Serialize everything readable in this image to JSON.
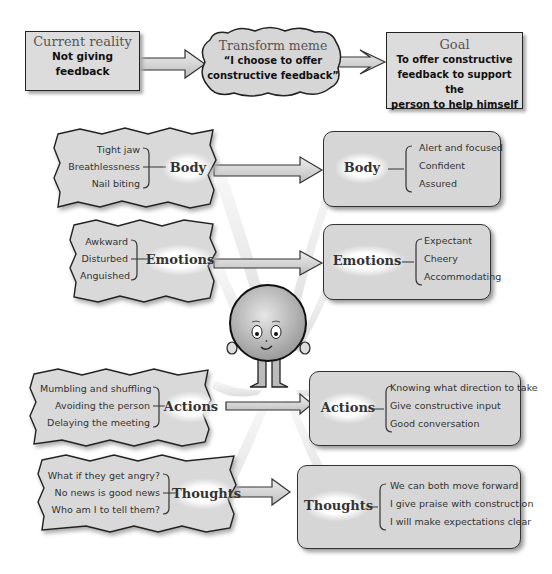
{
  "top_row": {
    "current": {
      "title": "Current reality",
      "lines": [
        "Not giving",
        "feedback"
      ]
    },
    "transform": {
      "title": "Transform meme",
      "lines": [
        "“I choose to offer",
        "constructive feedback”"
      ]
    },
    "goal": {
      "title": "Goal",
      "lines": [
        "To offer constructive",
        "feedback to support the",
        "person to help himself"
      ]
    }
  },
  "left": [
    {
      "label": "Body",
      "items": [
        "Tight jaw",
        "Breathlessness",
        "Nail biting"
      ]
    },
    {
      "label": "Emotions",
      "items": [
        "Awkward",
        "Disturbed",
        "Anguished"
      ]
    },
    {
      "label": "Actions",
      "items": [
        "Mumbling and shuffling",
        "Avoiding the person",
        "Delaying the meeting"
      ]
    },
    {
      "label": "Thoughts",
      "items": [
        "What if they get angry?",
        "No news is good news",
        "Who am I to tell them?"
      ]
    }
  ],
  "right": [
    {
      "label": "Body",
      "items": [
        "Alert and focused",
        "Confident",
        "Assured"
      ]
    },
    {
      "label": "Emotions",
      "items": [
        "Expectant",
        "Cheery",
        "Accommodating"
      ]
    },
    {
      "label": "Actions",
      "items": [
        "Knowing what direction to take",
        "Give constructive input",
        "Good conversation"
      ]
    },
    {
      "label": "Thoughts",
      "items": [
        "We can both move forward",
        "I give praise with construction",
        "I will make expectations clear"
      ]
    }
  ],
  "colors": {
    "box_fill": "#d6d6d6",
    "outline": "#222222",
    "arrow_fill": "#cfcfcf"
  }
}
